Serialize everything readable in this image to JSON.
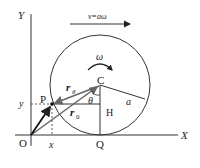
{
  "diagram": {
    "axes": {
      "x_label": "X",
      "y_label": "Y",
      "origin_label": "O"
    },
    "velocity_label": "v=aω",
    "omega_label": "ω",
    "center_label": "C",
    "point_label": "P",
    "foot_label": "Q",
    "h_label": "H",
    "theta_label": "θ",
    "radius_label": "a",
    "r_theta_main": "r",
    "r_theta_sub": "θ",
    "r0_main": "r",
    "r0_sub": "0",
    "x_coord_label": "x",
    "y_coord_label": "y",
    "colors": {
      "ink": "#222222",
      "gray_vector": "#666666"
    }
  }
}
